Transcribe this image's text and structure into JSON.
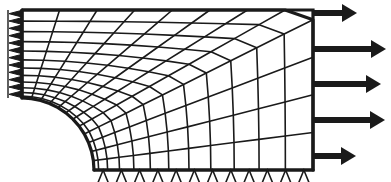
{
  "figure": {
    "width": 391,
    "height": 182,
    "background_color": "#ffffff",
    "line_color": "#1a1a1a"
  },
  "geometry": {
    "description": "Quarter symmetry model of a rectangular plate containing a circular hole, subjected to uniform tension on the right edge.",
    "hole": {
      "shape": "quarter-circle",
      "center_x": 22,
      "center_y": 170,
      "radius": 72
    },
    "plate": {
      "left_x": 22,
      "right_x": 313,
      "top_y": 10,
      "bottom_y": 170
    }
  },
  "mesh": {
    "type": "mapped-quadrilateral",
    "radial_divisions": 12,
    "circumferential_divisions": 12,
    "radial_bias": "fine near hole",
    "element_edge_color": "#1a1a1a",
    "element_edge_width": 1.6,
    "boundary_edge_width": 3.2
  },
  "supports": {
    "left_edge": {
      "symbol": "roller-triangle",
      "orientation": "horizontal-restraint",
      "count": 12,
      "filled": true,
      "size": 13,
      "x": 22,
      "y_start": 10,
      "y_end": 170
    },
    "bottom_edge": {
      "symbol": "roller-triangle",
      "orientation": "vertical-restraint",
      "count": 12,
      "filled": false,
      "size": 13,
      "y": 170,
      "x_start": 94,
      "x_end": 313
    }
  },
  "loads": {
    "edge": "right",
    "direction": "tension-positive-x",
    "arrow_color": "#1a1a1a",
    "arrow_shaft_thickness": 6,
    "arrows": [
      {
        "id": "load-arrow-1",
        "y": 13,
        "x_start": 313,
        "x_end": 357
      },
      {
        "id": "load-arrow-2",
        "y": 49,
        "x_start": 313,
        "x_end": 386
      },
      {
        "id": "load-arrow-3",
        "y": 84,
        "x_start": 313,
        "x_end": 381
      },
      {
        "id": "load-arrow-4",
        "y": 120,
        "x_start": 313,
        "x_end": 385
      },
      {
        "id": "load-arrow-5",
        "y": 156,
        "x_start": 313,
        "x_end": 356
      }
    ]
  }
}
